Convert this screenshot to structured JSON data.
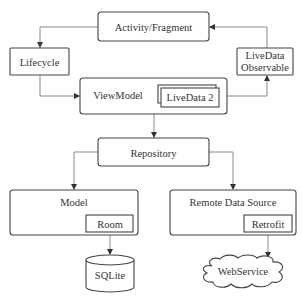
{
  "diagram": {
    "type": "architecture",
    "nodes": {
      "activity": {
        "label": "Activity/Fragment"
      },
      "lifecycle": {
        "label": "Lifecycle"
      },
      "livedata_observable": {
        "line1": "LiveData",
        "line2": "Observable"
      },
      "viewmodel": {
        "label": "ViewModel"
      },
      "livedata2": {
        "label": "LiveData 2"
      },
      "repository": {
        "label": "Repository"
      },
      "model": {
        "label": "Model"
      },
      "room": {
        "label": "Room"
      },
      "sqlite": {
        "label": "SQLite"
      },
      "remote": {
        "label": "Remote Data Source"
      },
      "retrofit": {
        "label": "Retrofit"
      },
      "webservice": {
        "label": "WebService"
      }
    },
    "edges": [
      {
        "from": "Activity/Fragment",
        "to": "Lifecycle"
      },
      {
        "from": "Lifecycle",
        "to": "ViewModel"
      },
      {
        "from": "ViewModel",
        "to": "LiveData Observable"
      },
      {
        "from": "LiveData Observable",
        "to": "Activity/Fragment"
      },
      {
        "from": "ViewModel",
        "to": "Repository"
      },
      {
        "from": "Repository",
        "to": "Model"
      },
      {
        "from": "Repository",
        "to": "Remote Data Source"
      },
      {
        "from": "Room",
        "to": "SQLite"
      },
      {
        "from": "Retrofit",
        "to": "WebService"
      }
    ]
  }
}
